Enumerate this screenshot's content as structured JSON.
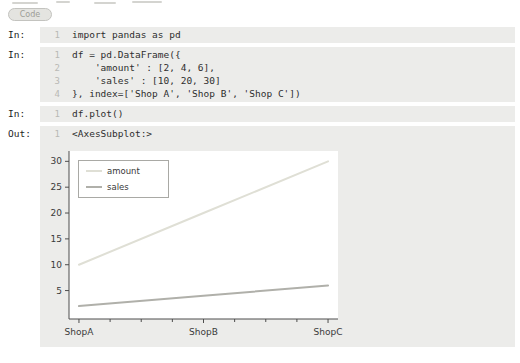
{
  "toolbar": {
    "code_label": "Code"
  },
  "ui_colors": {
    "cell_background": "#ececea",
    "pill_text": "#9d9d97",
    "line_number": "#b9b9b5",
    "axis": "#4d4d4d"
  },
  "cells": [
    {
      "type": "input",
      "label": "In:",
      "lines": [
        {
          "num": "1",
          "code": "import pandas as pd"
        }
      ]
    },
    {
      "type": "input",
      "label": "In:",
      "lines": [
        {
          "num": "1",
          "code": "df = pd.DataFrame({"
        },
        {
          "num": "2",
          "code": "    'amount' : [2, 4, 6],"
        },
        {
          "num": "3",
          "code": "    'sales' : [10, 20, 30]"
        },
        {
          "num": "4",
          "code": "}, index=['Shop A', 'Shop B', 'Shop C'])"
        }
      ]
    },
    {
      "type": "input",
      "label": "In:",
      "lines": [
        {
          "num": "1",
          "code": "df.plot()"
        }
      ]
    },
    {
      "type": "output",
      "label": "Out:",
      "lines": [
        {
          "num": "1",
          "code": "<AxesSubplot:>"
        }
      ]
    }
  ],
  "chart_data": {
    "type": "line",
    "title": "",
    "xlabel": "",
    "ylabel": "",
    "x": [
      0,
      1,
      2
    ],
    "x_tick_labels": [
      "ShopA",
      "ShopB",
      "ShopC"
    ],
    "y_ticks": [
      5,
      10,
      15,
      20,
      25,
      30
    ],
    "ylim": [
      -0.5,
      32
    ],
    "xlim": [
      -0.08,
      2.08
    ],
    "grid": false,
    "legend_position": "upper left",
    "series": [
      {
        "name": "amount",
        "values": [
          2,
          4,
          6
        ],
        "line_color": "#b0b0aa",
        "legend_swatch_color": "#dfdfd5"
      },
      {
        "name": "sales",
        "values": [
          10,
          20,
          30
        ],
        "line_color": "#dfdfd5",
        "legend_swatch_color": "#b0b0aa"
      }
    ],
    "plot_bg_color": "#ffffff"
  }
}
